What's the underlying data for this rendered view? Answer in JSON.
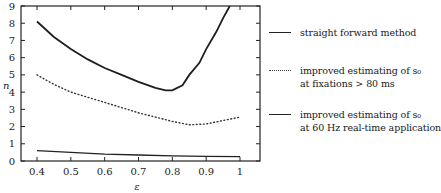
{
  "chart_data": {
    "type": "line",
    "title": "",
    "xlabel": "ε",
    "ylabel": "n",
    "xlim": [
      0.37,
      1.06
    ],
    "ylim": [
      0,
      9
    ],
    "xticks": [
      0.4,
      0.5,
      0.6,
      0.7,
      0.8,
      0.9,
      1.0
    ],
    "xtick_labels": [
      "0.4",
      "0.5",
      "0.6",
      "0.7",
      "0.8",
      "0.9",
      "1"
    ],
    "yticks": [
      0,
      1,
      2,
      3,
      4,
      5,
      6,
      7,
      8,
      9
    ],
    "ytick_labels": [
      "0",
      "1",
      "2",
      "3",
      "4",
      "5",
      "6",
      "7",
      "8",
      "9"
    ],
    "grid": false,
    "legend_position": "right-outside",
    "series": [
      {
        "name": "straight forward method",
        "style": "solid",
        "x": [
          0.4,
          0.45,
          0.5,
          0.55,
          0.6,
          0.65,
          0.7,
          0.75,
          0.78,
          0.8,
          0.83,
          0.85,
          0.88,
          0.9,
          0.93,
          0.95,
          0.97
        ],
        "y": [
          8.1,
          7.2,
          6.5,
          5.9,
          5.4,
          5.0,
          4.6,
          4.25,
          4.1,
          4.1,
          4.4,
          5.0,
          5.7,
          6.5,
          7.5,
          8.3,
          9.0
        ]
      },
      {
        "name": "improved estimating of s0 at fixations > 80 ms",
        "style": "dotted",
        "x": [
          0.4,
          0.45,
          0.5,
          0.55,
          0.6,
          0.65,
          0.7,
          0.75,
          0.8,
          0.85,
          0.9,
          0.95,
          1.0
        ],
        "y": [
          5.0,
          4.45,
          4.0,
          3.7,
          3.4,
          3.1,
          2.8,
          2.55,
          2.3,
          2.1,
          2.15,
          2.35,
          2.55
        ]
      },
      {
        "name": "improved estimating of s0 at 60 Hz real-time application",
        "style": "solid-thin",
        "x": [
          0.4,
          0.5,
          0.6,
          0.7,
          0.8,
          0.9,
          1.0
        ],
        "y": [
          0.6,
          0.5,
          0.4,
          0.35,
          0.3,
          0.27,
          0.25
        ]
      }
    ]
  },
  "legend": [
    {
      "style": "solid",
      "lines": [
        "straight forward method"
      ]
    },
    {
      "style": "dotted",
      "lines": [
        "improved estimating of s₀",
        "at fixations > 80 ms"
      ]
    },
    {
      "style": "solid-thin",
      "lines": [
        "improved estimating of s₀",
        "at 60 Hz real-time application"
      ]
    }
  ]
}
